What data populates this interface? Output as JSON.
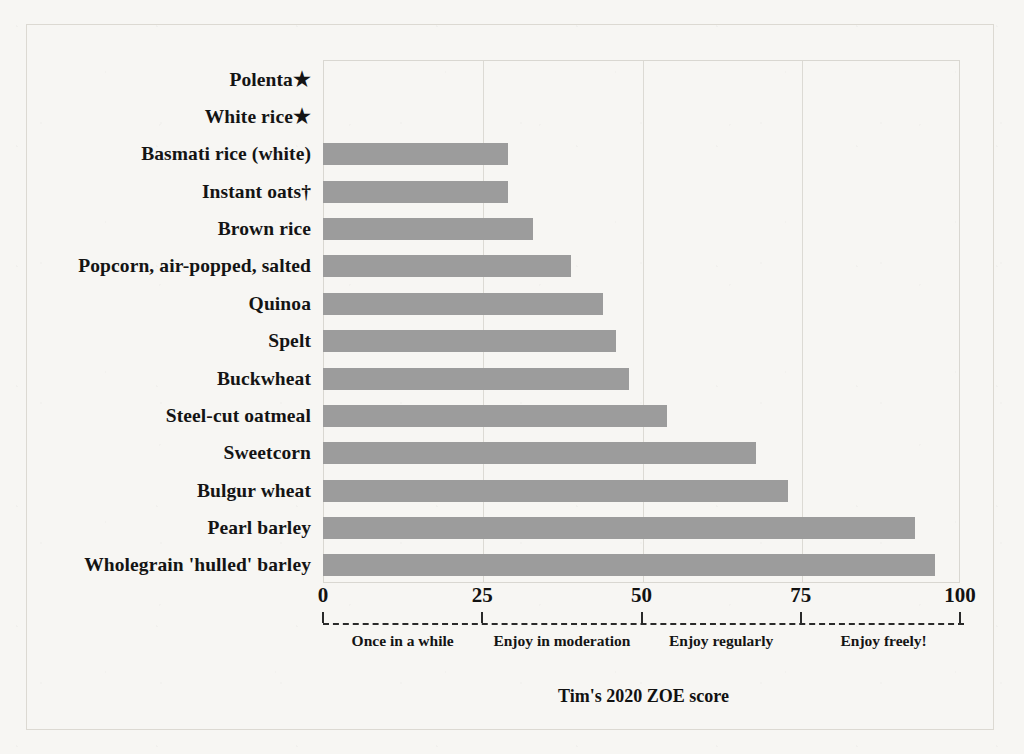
{
  "figure": {
    "x_axis_title": "Tim's 2020 ZOE score"
  },
  "chart_data": {
    "type": "bar",
    "orientation": "horizontal",
    "title": "",
    "xlabel": "Tim's 2020 ZOE score",
    "ylabel": "",
    "xlim": [
      0,
      100
    ],
    "ylim": null,
    "grid": "vertical gridlines at 25, 50, 75",
    "legend": "none",
    "xticks": [
      0,
      25,
      50,
      75,
      100
    ],
    "xtick_labels": [
      "0",
      "25",
      "50",
      "75",
      "100"
    ],
    "categories": [
      "Polenta★",
      "White rice★",
      "Basmati rice (white)",
      "Instant oats†",
      "Brown rice",
      "Popcorn, air-popped, salted",
      "Quinoa",
      "Spelt",
      "Buckwheat",
      "Steel-cut oatmeal",
      "Sweetcorn",
      "Bulgur wheat",
      "Pearl barley",
      "Wholegrain 'hulled' barley"
    ],
    "values": [
      0,
      0,
      29,
      29,
      33,
      39,
      44,
      46,
      48,
      54,
      68,
      73,
      93,
      96
    ],
    "bar_color": "#9c9c9c",
    "annotations": [
      {
        "label": "Once in a while",
        "range": [
          0,
          25
        ],
        "center": 12.5
      },
      {
        "label": "Enjoy in moderation",
        "range": [
          25,
          50
        ],
        "center": 37.5
      },
      {
        "label": "Enjoy regularly",
        "range": [
          50,
          75
        ],
        "center": 62.5
      },
      {
        "label": "Enjoy freely!",
        "range": [
          75,
          100
        ],
        "center": 88
      }
    ]
  }
}
